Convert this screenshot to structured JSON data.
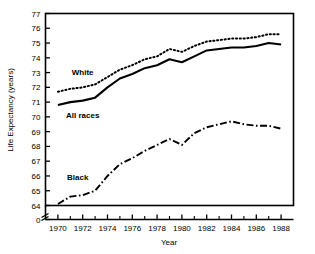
{
  "chart_data": {
    "type": "line",
    "title": "",
    "xlabel": "Year",
    "ylabel": "Life Expectancy (years)",
    "xlim": [
      1969,
      1989
    ],
    "ylim": [
      64,
      77
    ],
    "y_axis_break": true,
    "y_break_label": "0",
    "grid": false,
    "legend_position": "inline-annotations",
    "xticks_major": [
      1970,
      1972,
      1974,
      1976,
      1978,
      1980,
      1982,
      1984,
      1986,
      1988
    ],
    "xticks_minor": [
      1971,
      1973,
      1975,
      1977,
      1979,
      1981,
      1983,
      1985,
      1987
    ],
    "xtick_labels": [
      "1970",
      "1972",
      "1974",
      "1976",
      "1978",
      "1980",
      "1982",
      "1984",
      "1986",
      "1988"
    ],
    "yticks": [
      64,
      65,
      66,
      67,
      68,
      69,
      70,
      71,
      72,
      73,
      74,
      75,
      76,
      77
    ],
    "ytick_labels": [
      "64",
      "65",
      "66",
      "67",
      "68",
      "69",
      "70",
      "71",
      "72",
      "73",
      "74",
      "75",
      "76",
      "77"
    ],
    "x": [
      1970,
      1971,
      1972,
      1973,
      1974,
      1975,
      1976,
      1977,
      1978,
      1979,
      1980,
      1981,
      1982,
      1983,
      1984,
      1985,
      1986,
      1987,
      1988
    ],
    "series": [
      {
        "name": "White",
        "label": "White",
        "style": "dotted",
        "color": "#000000",
        "label_x": 1972.0,
        "label_y": 72.85,
        "values": [
          71.7,
          71.9,
          72.0,
          72.2,
          72.7,
          73.2,
          73.5,
          73.9,
          74.1,
          74.6,
          74.4,
          74.8,
          75.1,
          75.2,
          75.3,
          75.3,
          75.4,
          75.6,
          75.6
        ]
      },
      {
        "name": "All races",
        "label": "All races",
        "style": "solid",
        "color": "#000000",
        "label_x": 1972.0,
        "label_y": 69.95,
        "values": [
          70.8,
          71.0,
          71.1,
          71.3,
          72.0,
          72.6,
          72.9,
          73.3,
          73.5,
          73.9,
          73.7,
          74.1,
          74.5,
          74.6,
          74.7,
          74.7,
          74.8,
          75.0,
          74.9
        ]
      },
      {
        "name": "Black",
        "label": "Black",
        "style": "dashdot",
        "color": "#000000",
        "label_x": 1971.6,
        "label_y": 65.7,
        "values": [
          64.1,
          64.6,
          64.7,
          65.0,
          66.0,
          66.8,
          67.2,
          67.7,
          68.1,
          68.5,
          68.1,
          68.9,
          69.3,
          69.5,
          69.7,
          69.5,
          69.4,
          69.4,
          69.2
        ]
      }
    ]
  }
}
